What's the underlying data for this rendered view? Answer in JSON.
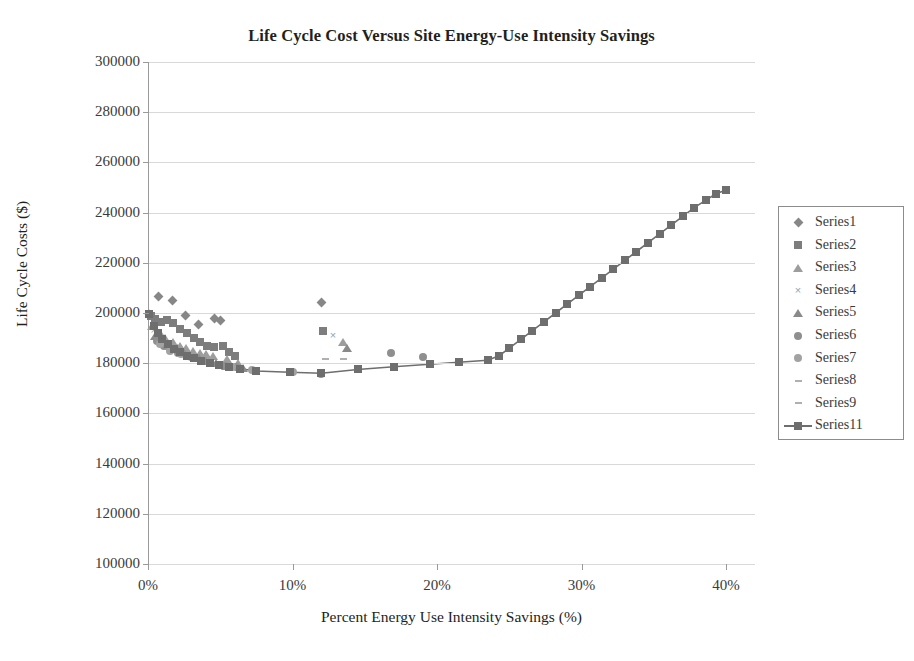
{
  "chart_data": {
    "type": "scatter",
    "title": "Life Cycle Cost Versus Site Energy-Use Intensity Savings",
    "xlabel": "Percent Energy Use Intensity Savings (%)",
    "ylabel": "Life Cycle Costs ($)",
    "xlim": [
      0,
      42
    ],
    "ylim": [
      100000,
      300000
    ],
    "xticks": [
      "0%",
      "10%",
      "20%",
      "30%",
      "40%"
    ],
    "xtick_values": [
      0,
      10,
      20,
      30,
      40
    ],
    "yticks": [
      "300000",
      "280000",
      "260000",
      "240000",
      "220000",
      "200000",
      "180000",
      "160000",
      "140000",
      "120000",
      "100000"
    ],
    "ytick_values": [
      300000,
      280000,
      260000,
      240000,
      220000,
      200000,
      180000,
      160000,
      140000,
      120000,
      100000
    ],
    "grid": "horizontal",
    "legend_position": "right",
    "colors": {
      "series_marker": "#878787",
      "line_series": "#6e6e6e",
      "gridline": "#d9d9d9",
      "axis": "#9a9a9a",
      "text": "#3a3a3a",
      "title": "#231f20"
    },
    "series": [
      {
        "name": "Series1",
        "marker": "diamond",
        "points": [
          [
            0.1,
            199500
          ],
          [
            0.7,
            206500
          ],
          [
            1.7,
            205000
          ],
          [
            2.6,
            199000
          ],
          [
            3.5,
            195500
          ],
          [
            4.6,
            198000
          ],
          [
            5.0,
            197000
          ],
          [
            12.0,
            204000
          ]
        ]
      },
      {
        "name": "Series2",
        "marker": "square",
        "points": [
          [
            0.2,
            199000
          ],
          [
            0.5,
            197800
          ],
          [
            0.9,
            196500
          ],
          [
            1.3,
            197200
          ],
          [
            1.7,
            196000
          ],
          [
            2.2,
            193500
          ],
          [
            2.7,
            192000
          ],
          [
            3.2,
            190000
          ],
          [
            3.6,
            188500
          ],
          [
            4.1,
            187000
          ],
          [
            4.6,
            186500
          ],
          [
            5.2,
            187000
          ],
          [
            5.6,
            184500
          ],
          [
            6.0,
            183000
          ],
          [
            12.1,
            193000
          ]
        ]
      },
      {
        "name": "Series3",
        "marker": "triangle",
        "points": [
          [
            0.3,
            195000
          ],
          [
            0.8,
            192000
          ],
          [
            1.2,
            190000
          ],
          [
            1.7,
            188500
          ],
          [
            2.2,
            187000
          ],
          [
            2.6,
            186000
          ],
          [
            3.1,
            185000
          ],
          [
            3.6,
            184000
          ],
          [
            4.0,
            183500
          ],
          [
            4.5,
            183000
          ],
          [
            5.5,
            181500
          ],
          [
            6.2,
            180000
          ],
          [
            13.5,
            188500
          ]
        ]
      },
      {
        "name": "Series4",
        "marker": "x",
        "points": [
          [
            0.4,
            193000
          ],
          [
            0.9,
            190500
          ],
          [
            1.4,
            188000
          ],
          [
            1.9,
            186500
          ],
          [
            2.4,
            185000
          ],
          [
            2.9,
            184000
          ],
          [
            3.4,
            183000
          ],
          [
            3.9,
            182000
          ],
          [
            4.4,
            181000
          ],
          [
            5.0,
            180000
          ],
          [
            12.8,
            191000
          ]
        ]
      },
      {
        "name": "Series5",
        "marker": "triangle-filled",
        "points": [
          [
            0.5,
            191000
          ],
          [
            1.0,
            189000
          ],
          [
            1.5,
            187000
          ],
          [
            2.0,
            185500
          ],
          [
            2.5,
            184000
          ],
          [
            3.0,
            183000
          ],
          [
            3.5,
            182000
          ],
          [
            4.0,
            181000
          ],
          [
            4.7,
            180000
          ],
          [
            5.4,
            179000
          ],
          [
            6.6,
            178000
          ],
          [
            13.8,
            186000
          ]
        ]
      },
      {
        "name": "Series6",
        "marker": "circle",
        "points": [
          [
            0.6,
            189000
          ],
          [
            1.1,
            187000
          ],
          [
            1.6,
            185500
          ],
          [
            2.1,
            184000
          ],
          [
            2.8,
            183000
          ],
          [
            3.3,
            182000
          ],
          [
            4.2,
            180500
          ],
          [
            5.3,
            179000
          ],
          [
            6.1,
            178500
          ],
          [
            7.5,
            176800
          ],
          [
            9.8,
            176500
          ],
          [
            12.0,
            175800
          ],
          [
            16.8,
            184000
          ],
          [
            19.0,
            182500
          ]
        ]
      },
      {
        "name": "Series7",
        "marker": "circle-light",
        "points": [
          [
            0.8,
            187500
          ],
          [
            1.5,
            185000
          ],
          [
            2.3,
            183500
          ],
          [
            3.0,
            182500
          ],
          [
            4.3,
            180500
          ],
          [
            5.8,
            178500
          ],
          [
            7.2,
            177200
          ],
          [
            10.0,
            176500
          ]
        ]
      },
      {
        "name": "Series8",
        "marker": "dash",
        "points": [
          [
            12.3,
            181800
          ]
        ]
      },
      {
        "name": "Series9",
        "marker": "dash",
        "points": [
          [
            13.5,
            181500
          ]
        ]
      },
      {
        "name": "Series11",
        "marker": "square-line",
        "line": true,
        "points": [
          [
            0.1,
            199500
          ],
          [
            0.4,
            195000
          ],
          [
            0.7,
            192000
          ],
          [
            1.0,
            189500
          ],
          [
            1.4,
            187500
          ],
          [
            1.8,
            185800
          ],
          [
            2.2,
            184300
          ],
          [
            2.7,
            183000
          ],
          [
            3.2,
            182000
          ],
          [
            3.7,
            181000
          ],
          [
            4.3,
            180000
          ],
          [
            4.9,
            179200
          ],
          [
            5.6,
            178400
          ],
          [
            6.4,
            177800
          ],
          [
            7.5,
            176900
          ],
          [
            9.8,
            176400
          ],
          [
            12.0,
            176000
          ],
          [
            14.5,
            177500
          ],
          [
            17.0,
            178600
          ],
          [
            19.5,
            179600
          ],
          [
            21.5,
            180400
          ],
          [
            23.5,
            181200
          ],
          [
            24.3,
            183000
          ],
          [
            25.0,
            186000
          ],
          [
            25.8,
            189500
          ],
          [
            26.6,
            193000
          ],
          [
            27.4,
            196500
          ],
          [
            28.2,
            200000
          ],
          [
            29.0,
            203500
          ],
          [
            29.8,
            207000
          ],
          [
            30.6,
            210500
          ],
          [
            31.4,
            214000
          ],
          [
            32.2,
            217500
          ],
          [
            33.0,
            221000
          ],
          [
            33.8,
            224500
          ],
          [
            34.6,
            228000
          ],
          [
            35.4,
            231500
          ],
          [
            36.2,
            235000
          ],
          [
            37.0,
            238500
          ],
          [
            37.8,
            242000
          ],
          [
            38.6,
            245000
          ],
          [
            39.3,
            247500
          ],
          [
            40.0,
            249000
          ]
        ]
      }
    ]
  }
}
